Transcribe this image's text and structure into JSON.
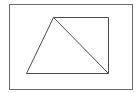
{
  "canvas": {
    "width": 137,
    "height": 93,
    "background": "#ffffff"
  },
  "frame": {
    "x": 9,
    "y": 4,
    "width": 123,
    "height": 85,
    "stroke": "#6a6a6a",
    "stroke_width": 1
  },
  "shape": {
    "type": "quadrilateral-with-diagonal",
    "stroke": "#4a4a4a",
    "stroke_width": 1,
    "vertices": [
      {
        "label": "",
        "x": 53,
        "y": 17
      },
      {
        "label": "",
        "x": 108,
        "y": 17
      },
      {
        "label": "",
        "x": 108,
        "y": 73
      },
      {
        "label": "",
        "x": 26,
        "y": 73
      }
    ],
    "diagonal": {
      "from": 0,
      "to": 2
    }
  }
}
